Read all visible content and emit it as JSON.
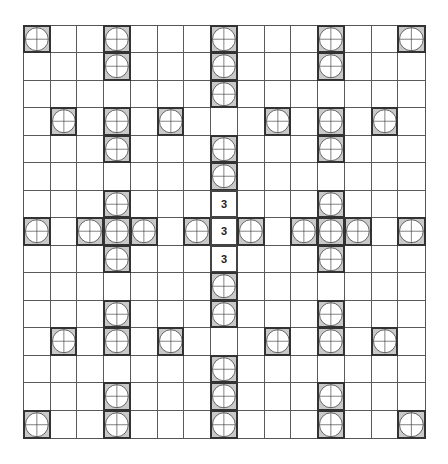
{
  "board": {
    "rows": 15,
    "cols": 15,
    "colors": {
      "grid_line": "#5a5a5a",
      "tile_fill": "#c9c9c9",
      "tile_border": "#333333",
      "circle_fill": "#ffffff",
      "circle_stroke": "#333333"
    },
    "tile_icon": "circle-crosshair-icon",
    "tiles": [
      [
        0,
        0
      ],
      [
        0,
        3
      ],
      [
        0,
        7
      ],
      [
        0,
        11
      ],
      [
        0,
        14
      ],
      [
        1,
        3
      ],
      [
        1,
        7
      ],
      [
        1,
        11
      ],
      [
        2,
        7
      ],
      [
        3,
        1
      ],
      [
        3,
        3
      ],
      [
        3,
        5
      ],
      [
        3,
        9
      ],
      [
        3,
        11
      ],
      [
        3,
        13
      ],
      [
        4,
        3
      ],
      [
        4,
        7
      ],
      [
        4,
        11
      ],
      [
        5,
        7
      ],
      [
        6,
        3
      ],
      [
        6,
        11
      ],
      [
        7,
        0
      ],
      [
        7,
        2
      ],
      [
        7,
        3
      ],
      [
        7,
        4
      ],
      [
        7,
        6
      ],
      [
        7,
        8
      ],
      [
        7,
        10
      ],
      [
        7,
        11
      ],
      [
        7,
        12
      ],
      [
        7,
        14
      ],
      [
        8,
        3
      ],
      [
        8,
        11
      ],
      [
        9,
        7
      ],
      [
        10,
        3
      ],
      [
        10,
        7
      ],
      [
        10,
        11
      ],
      [
        11,
        1
      ],
      [
        11,
        3
      ],
      [
        11,
        5
      ],
      [
        11,
        9
      ],
      [
        11,
        11
      ],
      [
        11,
        13
      ],
      [
        12,
        7
      ],
      [
        13,
        3
      ],
      [
        13,
        7
      ],
      [
        13,
        11
      ],
      [
        14,
        0
      ],
      [
        14,
        3
      ],
      [
        14,
        7
      ],
      [
        14,
        11
      ],
      [
        14,
        14
      ]
    ],
    "numbers": [
      {
        "row": 6,
        "col": 7,
        "value": "3"
      },
      {
        "row": 7,
        "col": 7,
        "value": "3"
      },
      {
        "row": 8,
        "col": 7,
        "value": "3"
      }
    ]
  }
}
